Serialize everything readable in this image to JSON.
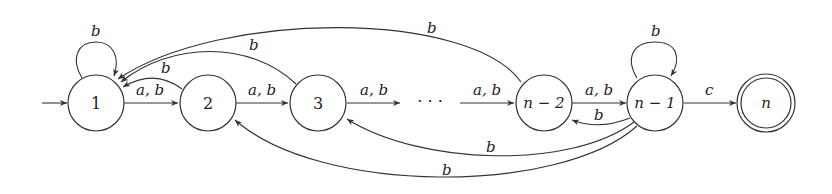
{
  "diagram": {
    "type": "finite-automaton",
    "states": [
      {
        "id": "s1",
        "label": "1",
        "initial": true,
        "accepting": false
      },
      {
        "id": "s2",
        "label": "2",
        "initial": false,
        "accepting": false
      },
      {
        "id": "s3",
        "label": "3",
        "initial": false,
        "accepting": false
      },
      {
        "id": "sdots",
        "label": "· · ·",
        "placeholder": true
      },
      {
        "id": "sn2",
        "label": "n − 2",
        "initial": false,
        "accepting": false
      },
      {
        "id": "sn1",
        "label": "n − 1",
        "initial": false,
        "accepting": false
      },
      {
        "id": "sn",
        "label": "n",
        "initial": false,
        "accepting": true
      }
    ],
    "transitions": [
      {
        "from": "s1",
        "to": "s1",
        "label": "b"
      },
      {
        "from": "s1",
        "to": "s2",
        "label": "a, b"
      },
      {
        "from": "s2",
        "to": "s1",
        "label": "b"
      },
      {
        "from": "s2",
        "to": "s3",
        "label": "a, b"
      },
      {
        "from": "s3",
        "to": "s1",
        "label": "b"
      },
      {
        "from": "s3",
        "to": "sdots",
        "label": "a, b"
      },
      {
        "from": "sdots",
        "to": "sn2",
        "label": "a, b"
      },
      {
        "from": "sn2",
        "to": "s1",
        "label": "b"
      },
      {
        "from": "sn2",
        "to": "sn1",
        "label": "a, b"
      },
      {
        "from": "sn1",
        "to": "sn2",
        "label": "b"
      },
      {
        "from": "sn1",
        "to": "sn1",
        "label": "b"
      },
      {
        "from": "sn1",
        "to": "s3",
        "label": "b"
      },
      {
        "from": "sn1",
        "to": "s2",
        "label": "b"
      },
      {
        "from": "sn1",
        "to": "sn",
        "label": "c"
      }
    ]
  }
}
